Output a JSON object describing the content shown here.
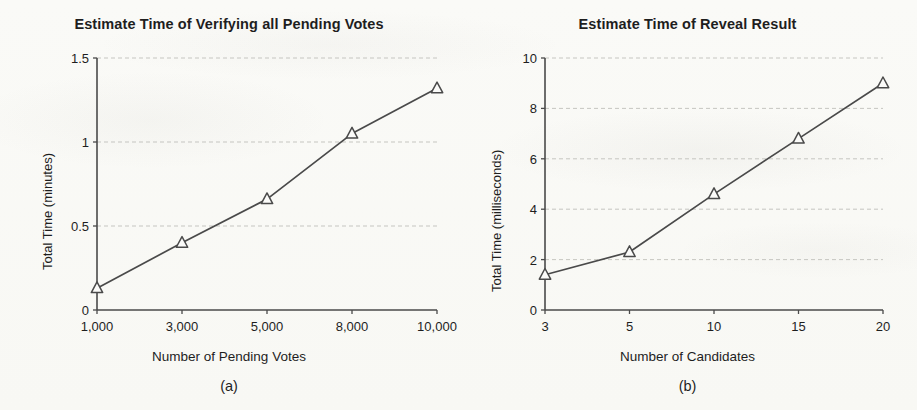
{
  "figure": {
    "background_color": "#fbfbf9",
    "ink_color": "#4a4a4a",
    "gridline_color": "#b9b9b4"
  },
  "panel_a": {
    "caption": "(a)",
    "chart_data": {
      "type": "line",
      "title": "Estimate Time of Verifying all Pending Votes",
      "xlabel": "Number of Pending Votes",
      "ylabel": "Total Time (minutes)",
      "categories": [
        "1,000",
        "3,000",
        "5,000",
        "8,000",
        "10,000"
      ],
      "values": [
        0.13,
        0.4,
        0.66,
        1.05,
        1.32
      ],
      "ytick_labels": [
        "0",
        "0.5",
        "1",
        "1.5"
      ],
      "ytick_values": [
        0,
        0.5,
        1,
        1.5
      ],
      "ylim": [
        0,
        1.5
      ],
      "grid": "horizontal-dashed",
      "legend": "none",
      "marker": "open-triangle",
      "series": [
        {
          "name": "Total Time (minutes)",
          "values": [
            0.13,
            0.4,
            0.66,
            1.05,
            1.32
          ]
        }
      ]
    }
  },
  "panel_b": {
    "caption": "(b)",
    "chart_data": {
      "type": "line",
      "title": "Estimate Time of Reveal Result",
      "xlabel": "Number of Candidates",
      "ylabel": "Total Time (milliseconds)",
      "categories": [
        "3",
        "5",
        "10",
        "15",
        "20"
      ],
      "values": [
        1.4,
        2.3,
        4.6,
        6.8,
        9.0
      ],
      "ytick_labels": [
        "0",
        "2",
        "4",
        "6",
        "8",
        "10"
      ],
      "ytick_values": [
        0,
        2,
        4,
        6,
        8,
        10
      ],
      "ylim": [
        0,
        10
      ],
      "grid": "horizontal-dashed",
      "legend": "none",
      "marker": "open-triangle",
      "series": [
        {
          "name": "Total Time (milliseconds)",
          "values": [
            1.4,
            2.3,
            4.6,
            6.8,
            9.0
          ]
        }
      ]
    }
  }
}
